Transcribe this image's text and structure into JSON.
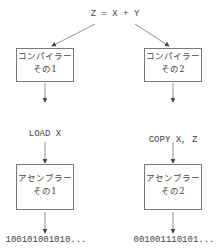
{
  "expression": "Z = X + Y",
  "left": {
    "compiler": {
      "line1": "コンパイラー",
      "line2": "その1"
    },
    "asm": [
      "LOAD X",
      "ADD Y",
      "STORE Z"
    ],
    "assembler": {
      "line1": "アセンブラー",
      "line2": "その1"
    },
    "binary": "100101001010..."
  },
  "right": {
    "compiler": {
      "line1": "コンパイラー",
      "line2": "その2"
    },
    "asm": [
      "COPY X, Z",
      "ADD Y, Z"
    ],
    "assembler": {
      "line1": "アセンブラー",
      "line2": "その2"
    },
    "binary": "001001110101..."
  }
}
